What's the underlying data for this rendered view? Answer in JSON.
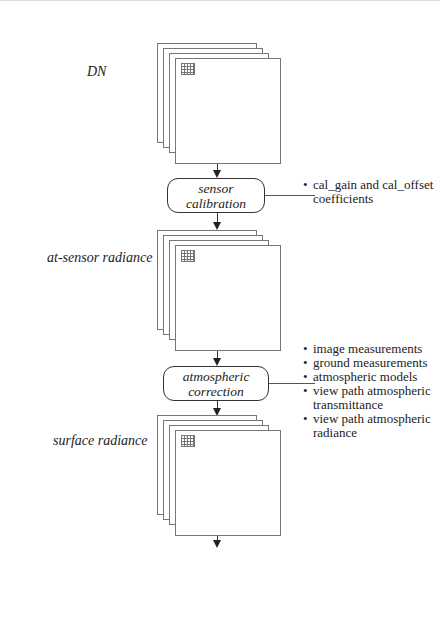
{
  "diagram": {
    "stages": [
      {
        "id": "dn",
        "label": "DN"
      },
      {
        "id": "at-sensor-radiance",
        "label": "at-sensor radiance"
      },
      {
        "id": "surface-radiance",
        "label": "surface radiance"
      },
      {
        "id": "surface-reflectance",
        "label": "surface reflectance"
      }
    ],
    "processes": [
      {
        "id": "sensor-calibration",
        "line1": "sensor",
        "line2": "calibration",
        "line3": "",
        "inputs": [
          "cal_gain and cal_offset coefficients"
        ]
      },
      {
        "id": "atmospheric-correction",
        "line1": "atmospheric",
        "line2": "correction",
        "line3": "",
        "inputs": [
          "image measurements",
          "ground measurements",
          "atmospheric models",
          "view path atmospheric transmittance",
          "view path atmospheric radiance"
        ]
      },
      {
        "id": "solar-topographic-correction",
        "line1": "solar and",
        "line2": "topographic",
        "line3": "correction",
        "inputs": [
          "solar exo-atmospheric spectral irradiance",
          "solar path atmospheric transmittance",
          "down-scattered radiance",
          "solar angle, DEM"
        ]
      }
    ],
    "colors": {
      "line": "#333333",
      "sheet_border": "#777777",
      "background": "#ffffff"
    }
  }
}
